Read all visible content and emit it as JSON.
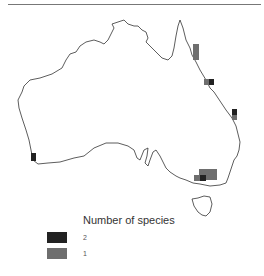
{
  "map": {
    "region": "Australia",
    "colors": {
      "coast": "#333333",
      "two_species": "#222222",
      "one_species": "#6e6e6e"
    },
    "occurrences": [
      {
        "location": "North Queensland coast",
        "value": 1
      },
      {
        "location": "Central Queensland coast",
        "value": 2
      },
      {
        "location": "Central Queensland coast (adjacent)",
        "value": 1
      },
      {
        "location": "Southeast Queensland",
        "value": 2
      },
      {
        "location": "Southeast Queensland (adjacent)",
        "value": 1
      },
      {
        "location": "Southwest Western Australia",
        "value": 2
      },
      {
        "location": "Victoria / southern NSW",
        "value": 1
      },
      {
        "location": "Victoria (Melbourne area)",
        "value": 2
      }
    ]
  },
  "legend": {
    "title": "Number of species",
    "items": [
      {
        "label": "2",
        "color": "#222222"
      },
      {
        "label": "1",
        "color": "#6e6e6e"
      }
    ]
  }
}
